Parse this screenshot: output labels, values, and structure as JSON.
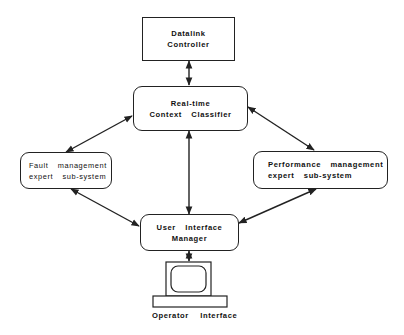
{
  "diagram": {
    "nodes": {
      "datalink": {
        "line1": "Datalink",
        "line2": "Controller"
      },
      "classifier": {
        "line1": "Real-time",
        "line2": "Context  Classifier"
      },
      "fault": {
        "line1": "Fault  management",
        "line2": "expert  sub-system"
      },
      "performance": {
        "line1": "Performance  management",
        "line2": "expert  sub-system"
      },
      "ui_manager": {
        "line1": "User  Interface",
        "line2": "Manager"
      },
      "operator": {
        "label": "Operator  Interface",
        "icon": "computer-terminal-icon"
      }
    },
    "edges": [
      {
        "from": "datalink",
        "to": "classifier",
        "type": "bidirectional"
      },
      {
        "from": "classifier",
        "to": "fault",
        "type": "bidirectional"
      },
      {
        "from": "classifier",
        "to": "performance",
        "type": "bidirectional"
      },
      {
        "from": "classifier",
        "to": "ui_manager",
        "type": "bidirectional"
      },
      {
        "from": "fault",
        "to": "ui_manager",
        "type": "bidirectional"
      },
      {
        "from": "performance",
        "to": "ui_manager",
        "type": "bidirectional"
      },
      {
        "from": "ui_manager",
        "to": "operator",
        "type": "bidirectional"
      }
    ],
    "colors": {
      "line": "#222222",
      "background": "#ffffff"
    }
  }
}
